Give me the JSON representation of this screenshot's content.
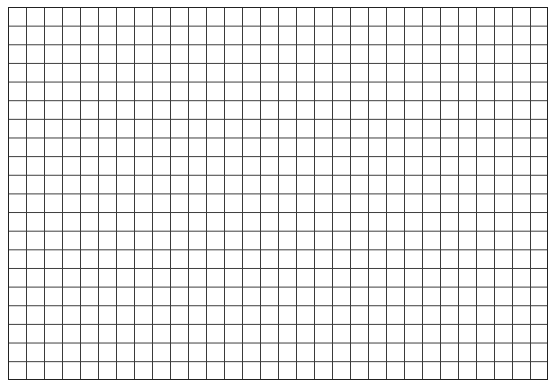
{
  "grid": {
    "columns": 30,
    "rows": 20,
    "line_color": "#3a3a3a",
    "border_color": "#222222",
    "background": "#ffffff"
  }
}
